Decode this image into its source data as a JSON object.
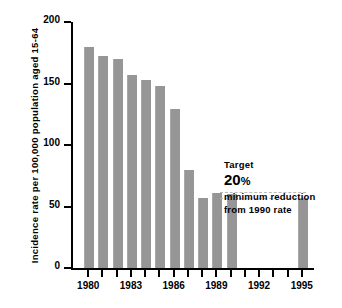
{
  "chart_data": {
    "type": "bar",
    "title": "",
    "subtitle": "",
    "xlabel": "",
    "ylabel": "Incidence rate per 100,000 population aged 15-64",
    "ylim": [
      0,
      200
    ],
    "xlim": [
      1979,
      1996
    ],
    "grid": false,
    "legend": null,
    "y_ticks": [
      {
        "value": 200,
        "label": "200"
      },
      {
        "value": 150,
        "label": "150"
      },
      {
        "value": 100,
        "label": "100"
      },
      {
        "value": 50,
        "label": "50"
      },
      {
        "value": 0,
        "label": "0"
      }
    ],
    "x_ticks": [
      {
        "value": 1980,
        "label": "1980"
      },
      {
        "value": 1981,
        "label": ""
      },
      {
        "value": 1982,
        "label": ""
      },
      {
        "value": 1983,
        "label": "1983"
      },
      {
        "value": 1984,
        "label": ""
      },
      {
        "value": 1985,
        "label": ""
      },
      {
        "value": 1986,
        "label": "1986"
      },
      {
        "value": 1987,
        "label": ""
      },
      {
        "value": 1988,
        "label": ""
      },
      {
        "value": 1989,
        "label": "1989"
      },
      {
        "value": 1990,
        "label": ""
      },
      {
        "value": 1991,
        "label": ""
      },
      {
        "value": 1992,
        "label": "1992"
      },
      {
        "value": 1993,
        "label": ""
      },
      {
        "value": 1994,
        "label": ""
      },
      {
        "value": 1995,
        "label": "1995"
      }
    ],
    "categories": [
      1980,
      1981,
      1982,
      1983,
      1984,
      1985,
      1986,
      1987,
      1988,
      1989,
      1995
    ],
    "values": [
      180,
      172,
      170,
      157,
      153,
      148,
      129,
      80,
      57,
      61,
      57
    ],
    "bars": [
      {
        "x": 1980,
        "value": 180,
        "color": "#969696"
      },
      {
        "x": 1981,
        "value": 172,
        "color": "#969696"
      },
      {
        "x": 1982,
        "value": 170,
        "color": "#969696"
      },
      {
        "x": 1983,
        "value": 157,
        "color": "#969696"
      },
      {
        "x": 1984,
        "value": 153,
        "color": "#969696"
      },
      {
        "x": 1985,
        "value": 148,
        "color": "#969696"
      },
      {
        "x": 1986,
        "value": 129,
        "color": "#969696"
      },
      {
        "x": 1987,
        "value": 80,
        "color": "#969696"
      },
      {
        "x": 1988,
        "value": 57,
        "color": "#969696"
      },
      {
        "x": 1989,
        "value": 61,
        "color": "#969696"
      },
      {
        "x": 1990,
        "value": 60,
        "color": "#969696"
      },
      {
        "x": 1995,
        "value": 57,
        "color": "#969696"
      }
    ],
    "reference_lines": [
      {
        "name": "1990-rate",
        "value": 62,
        "style": "dashed",
        "color": "#b9b9b9",
        "from_x": 1989.5,
        "to_x": 1995.5
      },
      {
        "name": "target-rate",
        "value": 57,
        "style": "dashed",
        "color": "#b9b9b9",
        "from_x": 1989.5,
        "to_x": 1995.5
      }
    ],
    "annotations": [
      {
        "name": "target-heading",
        "text": "Target"
      },
      {
        "name": "target-percent",
        "text": "20",
        "suffix": "%"
      },
      {
        "name": "target-line-3",
        "text": "minimum reduction"
      },
      {
        "name": "target-line-4",
        "text": "from 1990 rate"
      }
    ],
    "colors": {
      "bar": "#969696",
      "axis": "#000000",
      "dashed": "#b9b9b9",
      "background": "#ffffff"
    }
  }
}
